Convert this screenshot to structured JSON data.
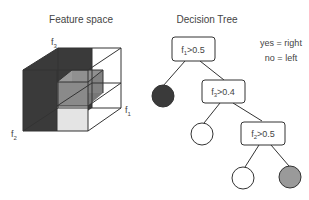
{
  "feature_space": {
    "title": "Feature space",
    "axis_labels": {
      "f1": "f",
      "f1_sub": "1",
      "f2": "f",
      "f2_sub": "2",
      "f3": "f",
      "f3_sub": "3"
    }
  },
  "decision_tree": {
    "title": "Decision Tree",
    "legend": {
      "yes": "yes = right",
      "no": "no = left"
    },
    "nodes": [
      {
        "feature": "f",
        "sub": "1",
        "cond": ">0.5"
      },
      {
        "feature": "f",
        "sub": "3",
        "cond": ">0.4"
      },
      {
        "feature": "f",
        "sub": "2",
        "cond": ">0.5"
      }
    ],
    "leaves": [
      {
        "color": "#3a3a3a"
      },
      {
        "color": "#ffffff"
      },
      {
        "color": "#ffffff"
      },
      {
        "color": "#9a9a9a"
      }
    ]
  },
  "colors": {
    "dark": "#3a3a3a",
    "mid": "#8a8a8a",
    "light": "#d9d9d9",
    "line": "#333333"
  }
}
